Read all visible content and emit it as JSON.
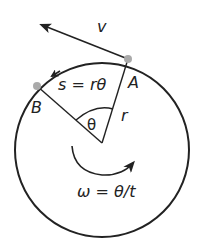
{
  "diagram": {
    "labels": {
      "velocity": "v",
      "point_a": "A",
      "point_b": "B",
      "radius": "r",
      "angle": "θ",
      "arc_length": "s = rθ",
      "angular_velocity": "ω = θ/t"
    },
    "colors": {
      "stroke": "#222222",
      "point": "#aaaaaa",
      "background": "#ffffff"
    }
  }
}
